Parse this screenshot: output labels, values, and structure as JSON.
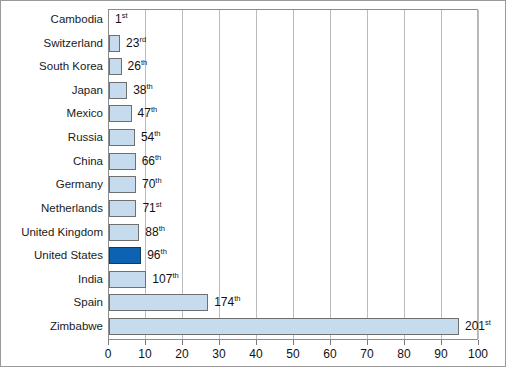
{
  "chart_data": {
    "type": "bar",
    "orientation": "horizontal",
    "title": "",
    "xlabel": "",
    "ylabel": "",
    "xlim": [
      0,
      100
    ],
    "xticks": [
      0,
      10,
      20,
      30,
      40,
      50,
      60,
      70,
      80,
      90,
      100
    ],
    "grid": true,
    "legend": false,
    "categories": [
      "Cambodia",
      "Switzerland",
      "South Korea",
      "Japan",
      "Mexico",
      "Russia",
      "China",
      "Germany",
      "Netherlands",
      "United Kingdom",
      "United States",
      "India",
      "Spain",
      "Zimbabwe"
    ],
    "values": [
      0,
      3,
      3.4,
      4.9,
      6.1,
      7,
      7.2,
      7.3,
      7.4,
      8.2,
      8.7,
      10.1,
      26.8,
      94.6
    ],
    "data_labels": [
      "1st",
      "23rd",
      "26th",
      "38th",
      "47th",
      "54th",
      "66th",
      "70th",
      "71st",
      "88th",
      "96th",
      "107th",
      "174th",
      "201st"
    ],
    "data_label_numbers": [
      1,
      23,
      26,
      38,
      47,
      54,
      66,
      70,
      71,
      88,
      96,
      107,
      174,
      201
    ],
    "data_label_suffixes": [
      "st",
      "rd",
      "th",
      "th",
      "th",
      "th",
      "th",
      "th",
      "st",
      "th",
      "th",
      "th",
      "th",
      "st"
    ],
    "highlight_category": "United States",
    "colors": {
      "bar_fill": "#c6dcee",
      "bar_border": "#6f6f6f",
      "highlight_fill": "#0d63b2",
      "highlight_border": "#05406f",
      "gridline": "#bcbcbc",
      "axis": "#8c8c8c",
      "text": "#111111",
      "background": "#ffffff"
    }
  }
}
